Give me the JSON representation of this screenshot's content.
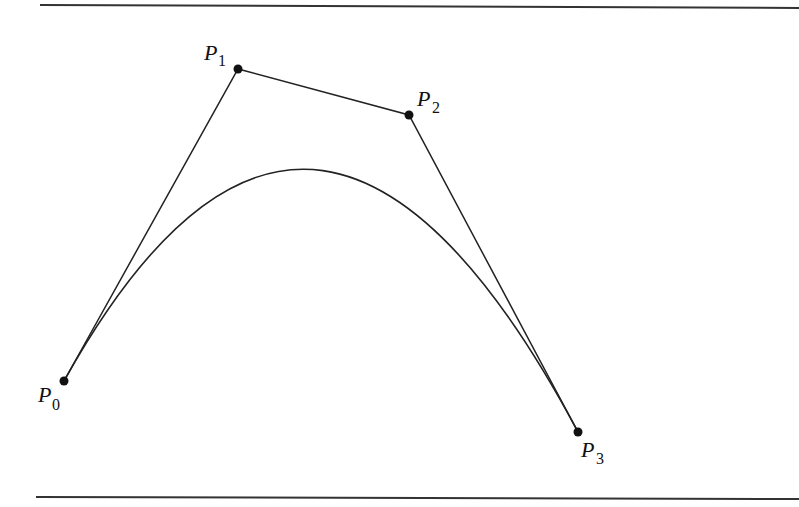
{
  "diagram": {
    "type": "cubic-bezier-curve",
    "rules": {
      "top": {
        "x1": 40,
        "y1": 5,
        "x2": 799,
        "y2": 8
      },
      "bottom": {
        "x1": 36,
        "y1": 497,
        "x2": 799,
        "y2": 499
      }
    },
    "control_points": [
      {
        "id": "P0",
        "letter": "P",
        "subscript": "0",
        "x": 64,
        "y": 381,
        "label_x": 38,
        "label_y": 402,
        "sub_x": 52,
        "sub_y": 410
      },
      {
        "id": "P1",
        "letter": "P",
        "subscript": "1",
        "x": 238,
        "y": 69,
        "label_x": 204,
        "label_y": 60,
        "sub_x": 218,
        "sub_y": 66
      },
      {
        "id": "P2",
        "letter": "P",
        "subscript": "2",
        "x": 409,
        "y": 115,
        "label_x": 417,
        "label_y": 106,
        "sub_x": 432,
        "sub_y": 113
      },
      {
        "id": "P3",
        "letter": "P",
        "subscript": "3",
        "x": 578,
        "y": 432,
        "label_x": 581,
        "label_y": 457,
        "sub_x": 596,
        "sub_y": 464
      }
    ],
    "colors": {
      "stroke": "#222222",
      "point": "#111111"
    }
  }
}
